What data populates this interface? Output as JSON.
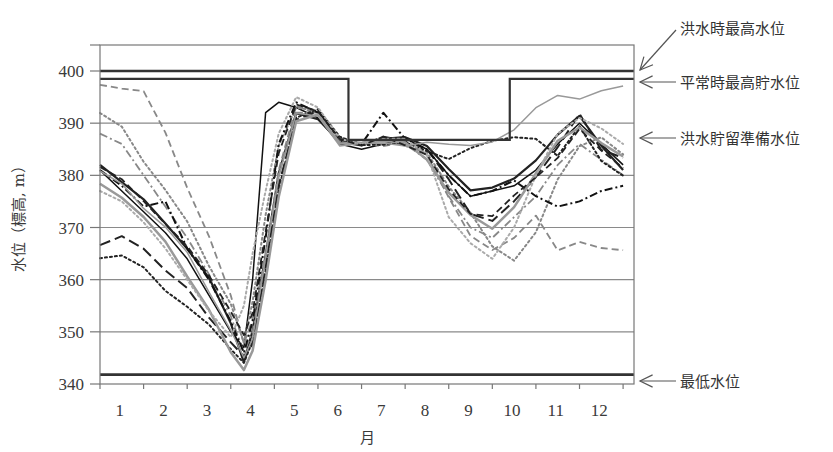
{
  "chart_data": {
    "type": "line",
    "title": "",
    "xlabel": "月",
    "ylabel": "水位（標高, m）",
    "xlim": [
      0.5,
      12.75
    ],
    "ylim": [
      340,
      405
    ],
    "x_ticks": [
      1,
      2,
      3,
      4,
      5,
      6,
      7,
      8,
      9,
      10,
      11,
      12
    ],
    "x_tick_labels": [
      "1",
      "2",
      "3",
      "4",
      "5",
      "6",
      "7",
      "8",
      "9",
      "10",
      "11",
      "12"
    ],
    "y_ticks": [
      340,
      350,
      360,
      370,
      380,
      390,
      400
    ],
    "y_tick_labels": [
      "340",
      "350",
      "360",
      "370",
      "380",
      "390",
      "400"
    ],
    "grid": "horizontal",
    "legend": "none",
    "reference_lines": [
      {
        "name": "洪水時最高水位",
        "value": 400
      },
      {
        "name": "平常時最高貯水位",
        "value": 398.5,
        "step": {
          "from_month": 6.2,
          "to_month": 9.9,
          "lowered_to": 386.8
        }
      },
      {
        "name": "洪水貯留準備水位",
        "value": 386.8
      },
      {
        "name": "最低水位",
        "value": 341.8
      }
    ],
    "annotations": [
      {
        "text": "洪水時最高水位",
        "points_to": 400
      },
      {
        "text": "平常時最高貯水位",
        "points_to": 398.5
      },
      {
        "text": "洪水貯留準備水位",
        "points_to": 386.8
      },
      {
        "text": "最低水位",
        "points_to": 341.8
      }
    ],
    "x": [
      0.5,
      1,
      1.5,
      2,
      2.5,
      3,
      3.5,
      3.8,
      4,
      4.3,
      4.6,
      5,
      5.5,
      6,
      6.5,
      7,
      7.5,
      8,
      8.5,
      9,
      9.5,
      10,
      10.5,
      11,
      11.5,
      12,
      12.5
    ],
    "series": [
      {
        "name": "年1",
        "style": "solid",
        "color": "#222222",
        "width": 2.2,
        "values": [
          382,
          379,
          375,
          371,
          366,
          360,
          352,
          344,
          350,
          365,
          380,
          392,
          391,
          386,
          386,
          387,
          387,
          386,
          381,
          377,
          378,
          379,
          383,
          388,
          391,
          386,
          381
        ]
      },
      {
        "name": "年2",
        "style": "solid",
        "color": "#111111",
        "width": 1.5,
        "values": [
          381,
          377,
          373,
          369,
          364,
          357,
          350,
          347,
          360,
          392,
          394,
          393,
          391,
          386,
          385,
          386,
          387,
          385,
          380,
          376,
          377,
          378,
          381,
          386,
          390,
          386,
          382
        ]
      },
      {
        "name": "年3",
        "style": "dash",
        "color": "#888888",
        "width": 1.8,
        "values": [
          397,
          397,
          396,
          388,
          378,
          368,
          357,
          348,
          352,
          365,
          381,
          393,
          392,
          387,
          386,
          386,
          386,
          384,
          376,
          368,
          366,
          368,
          372,
          366,
          367,
          366,
          366
        ]
      },
      {
        "name": "年4",
        "style": "dot",
        "color": "#888888",
        "width": 2,
        "values": [
          392,
          389,
          383,
          377,
          371,
          363,
          355,
          348,
          356,
          372,
          386,
          393,
          392,
          387,
          386,
          387,
          386,
          384,
          378,
          373,
          366,
          364,
          369,
          379,
          386,
          387,
          384
        ]
      },
      {
        "name": "年5",
        "style": "dashdot",
        "color": "#888888",
        "width": 1.8,
        "values": [
          388,
          386,
          380,
          374,
          368,
          361,
          353,
          346,
          350,
          364,
          380,
          392,
          392,
          387,
          386,
          386,
          386,
          383,
          376,
          370,
          368,
          372,
          376,
          382,
          386,
          383,
          380
        ]
      },
      {
        "name": "年6",
        "style": "longdash",
        "color": "#222222",
        "width": 2,
        "values": [
          367,
          368,
          366,
          362,
          358,
          353,
          348,
          345,
          348,
          362,
          378,
          391,
          392,
          387,
          386,
          387,
          387,
          385,
          379,
          373,
          371,
          375,
          380,
          385,
          392,
          385,
          383
        ]
      },
      {
        "name": "年7",
        "style": "dot",
        "color": "#222222",
        "width": 2,
        "values": [
          364,
          365,
          362,
          358,
          355,
          351,
          347,
          344,
          348,
          362,
          377,
          391,
          393,
          387,
          386,
          386,
          386,
          385,
          383,
          385,
          387,
          387,
          387,
          384,
          389,
          383,
          380
        ]
      },
      {
        "name": "年8",
        "style": "dashdot",
        "color": "#111111",
        "width": 2,
        "values": [
          381,
          378,
          374,
          375,
          366,
          360,
          352,
          346,
          352,
          368,
          386,
          394,
          392,
          387,
          386,
          392,
          387,
          385,
          380,
          376,
          377,
          379,
          376,
          374,
          375,
          377,
          378
        ]
      },
      {
        "name": "年9",
        "style": "solid",
        "color": "#999999",
        "width": 2.5,
        "values": [
          378,
          376,
          372,
          367,
          361,
          354,
          346,
          343,
          346,
          360,
          376,
          390,
          392,
          386,
          386,
          387,
          386,
          383,
          377,
          372,
          370,
          374,
          380,
          387,
          389,
          386,
          384
        ]
      },
      {
        "name": "年10",
        "style": "solid",
        "color": "#999999",
        "width": 1.5,
        "values": [
          381,
          378,
          374,
          370,
          365,
          358,
          350,
          345,
          349,
          364,
          380,
          392,
          391,
          386,
          386,
          386,
          386,
          386,
          386,
          386,
          386,
          389,
          393,
          395,
          395,
          396,
          397
        ]
      },
      {
        "name": "年11",
        "style": "dot",
        "color": "#aaaaaa",
        "width": 2,
        "values": [
          377,
          375,
          371,
          366,
          360,
          354,
          349,
          355,
          365,
          377,
          388,
          395,
          393,
          387,
          386,
          387,
          387,
          384,
          372,
          367,
          364,
          370,
          380,
          388,
          391,
          389,
          386
        ]
      },
      {
        "name": "年12",
        "style": "dash",
        "color": "#222222",
        "width": 1.8,
        "values": [
          382,
          379,
          375,
          371,
          366,
          361,
          354,
          349,
          354,
          369,
          384,
          394,
          392,
          387,
          386,
          387,
          386,
          384,
          377,
          373,
          372,
          376,
          380,
          383,
          389,
          385,
          381
        ]
      }
    ]
  },
  "labels": {
    "ylabel": "水位（標高, m）",
    "xlabel": "月",
    "annot_flood_max": "洪水時最高水位",
    "annot_normal_max": "平常時最高貯水位",
    "annot_flood_prep": "洪水貯留準備水位",
    "annot_min": "最低水位"
  }
}
